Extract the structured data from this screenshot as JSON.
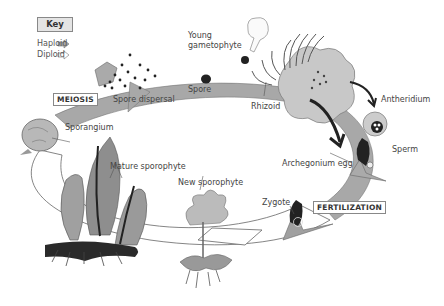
{
  "diagram": {
    "type": "life-cycle"
  },
  "key": {
    "title": "Key",
    "items": [
      {
        "label": "Haploid",
        "style": "filled-arrow",
        "color": "#b0b0b0"
      },
      {
        "label": "Diploid",
        "style": "outline-arrow",
        "color": "#ffffff"
      }
    ]
  },
  "stages": {
    "meiosis": "MEIOSIS",
    "fertilization": "FERTILIZATION"
  },
  "labels": {
    "spore_dispersal": "Spore dispersal",
    "spore": "Spore",
    "young_gametophyte_1": "Young",
    "young_gametophyte_2": "gametophyte",
    "rhizoid": "Rhizoid",
    "antheridium": "Antheridium",
    "sperm": "Sperm",
    "archegonium_egg": "Archegonium egg",
    "zygote": "Zygote",
    "new_sporophyte": "New sporophyte",
    "mature_sporophyte": "Mature sporophyte",
    "sporangium": "Sporangium"
  },
  "colors": {
    "haploid_band": "#a8a8a8",
    "diploid_band": "#ffffff",
    "outline": "#555555",
    "dark": "#222222",
    "plant_gray": "#9a9a9a"
  }
}
